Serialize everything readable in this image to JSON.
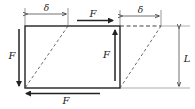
{
  "diagram": {
    "labels": {
      "delta_left": "δ",
      "delta_right": "δ",
      "force_top": "F",
      "force_left": "F",
      "force_right": "F",
      "force_bottom": "F",
      "length": "L"
    },
    "colors": {
      "line": "#222222",
      "background": "#ffffff"
    }
  }
}
